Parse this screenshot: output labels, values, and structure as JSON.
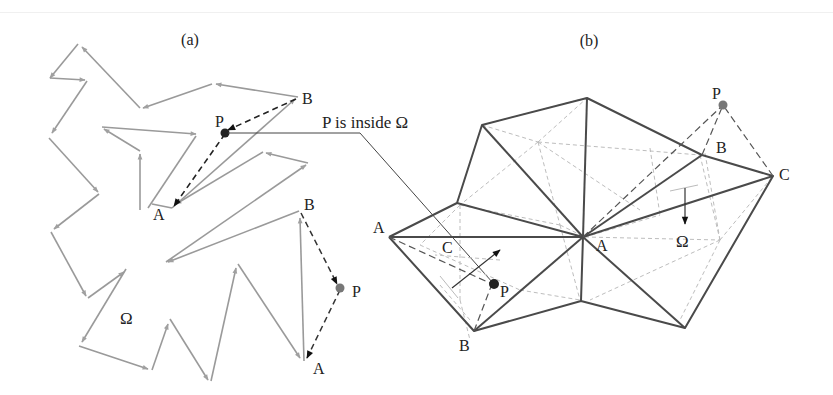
{
  "figure": {
    "panel_a": {
      "label": "(a)",
      "region_label": "Ω",
      "callout": "P is inside Ω",
      "case1": {
        "A": "A",
        "B": "B",
        "P": "P"
      },
      "case2": {
        "A": "A",
        "B": "B",
        "P": "P"
      }
    },
    "panel_b": {
      "label": "(b)",
      "region_label": "Ω",
      "case1": {
        "A": "A",
        "B": "B",
        "C": "C",
        "P": "P"
      },
      "case2": {
        "A": "A",
        "B": "B",
        "C": "C",
        "P": "P"
      }
    },
    "colors": {
      "polygon_edge": "#9a9a9a",
      "mesh_edge": "#4a4a4a",
      "mesh_dashed": "#bdbdbd",
      "construction_dashed": "#555555",
      "point": "#222222",
      "point_outside": "#777777"
    }
  }
}
